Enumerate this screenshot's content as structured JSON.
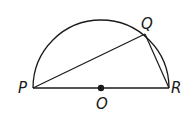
{
  "diagram": {
    "type": "semicircle",
    "center": {
      "label": "O",
      "x": 101,
      "y": 88
    },
    "radius": 68,
    "points": [
      {
        "label": "P",
        "x": 33,
        "y": 88
      },
      {
        "label": "Q",
        "x": 145,
        "y": 34
      },
      {
        "label": "R",
        "x": 169,
        "y": 88
      }
    ],
    "segments": [
      [
        "P",
        "R"
      ],
      [
        "P",
        "Q"
      ],
      [
        "Q",
        "R"
      ]
    ],
    "stroke_color": "#1a1a1a"
  }
}
